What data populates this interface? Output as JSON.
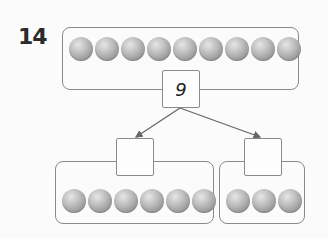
{
  "problem": {
    "number": "14",
    "whole": {
      "value": "9",
      "ball_count": 9
    },
    "parts": [
      {
        "value": "",
        "ball_count": 6
      },
      {
        "value": "",
        "ball_count": 3
      }
    ]
  },
  "colors": {
    "border": "#8a8a8a",
    "ball": "#a8a8a8",
    "arrow": "#666666",
    "text": "#2b2b2b"
  }
}
